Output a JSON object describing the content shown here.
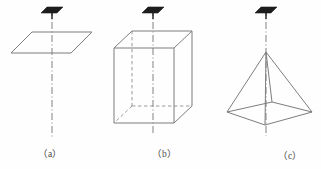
{
  "figure": {
    "kind": "geometry-diagram",
    "background_color": "#fefefe",
    "stroke_color": "#808080",
    "marker_color": "#1a1a1a",
    "axis_color": "#8c8c8c",
    "width": 321,
    "height": 169,
    "panels": [
      {
        "id": "a",
        "caption": "（a）",
        "shape_name": "parallelogram-plane",
        "description": "plane shown as a parallelogram with a vertical dash-dot axis",
        "axis": {
          "x": 52,
          "y1": 8,
          "y2": 138
        },
        "marker": {
          "cx": 52,
          "cy": 12
        }
      },
      {
        "id": "b",
        "caption": "（b）",
        "shape_name": "rectangular-prism",
        "description": "cuboid in oblique projection with hidden edges dashed and a vertical dash-dot axis",
        "axis": {
          "x": 153,
          "y1": 8,
          "y2": 135
        },
        "marker": {
          "cx": 153,
          "cy": 12
        }
      },
      {
        "id": "c",
        "caption": "（c）",
        "shape_name": "square-pyramid",
        "description": "square pyramid with a vertical dash-dot axis through the apex",
        "axis": {
          "x": 266,
          "y1": 8,
          "y2": 136
        },
        "marker": {
          "cx": 266,
          "cy": 12
        }
      }
    ]
  },
  "geometry": {
    "plane_a": {
      "points": "11,53 32,32 92,32 71,53",
      "label": "plane parallelogram"
    },
    "prism_b": {
      "front_face": "114,48 174,48 174,123 114,123",
      "top_face": "114,48 132,31 192,31 174,48",
      "right_face": "174,48 192,31 192,106 174,123",
      "hidden_vertical": "132,31 132,106",
      "hidden_back_left": "114,123 132,106",
      "hidden_back_right": "132,106 192,106",
      "label": "cuboid edges"
    },
    "pyramid_c": {
      "apex": "266,52",
      "base": "227,112 272,102 312,112 265,125",
      "edges": [
        "266,52 227,112",
        "266,52 312,112",
        "266,52 265,125",
        "266,52 272,102"
      ],
      "label": "pyramid edges"
    }
  }
}
